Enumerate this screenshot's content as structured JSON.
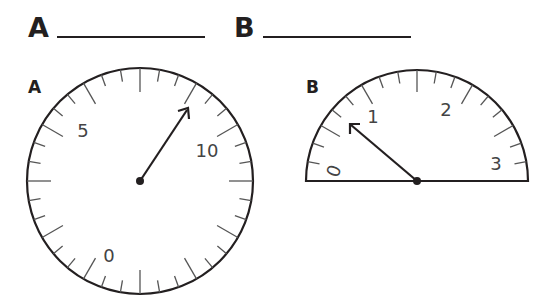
{
  "answers": [
    {
      "letter": "A",
      "value": ""
    },
    {
      "letter": "B",
      "value": ""
    }
  ],
  "gauges": {
    "A": {
      "label": "A",
      "shape": "circle",
      "scale_labels": [
        "0",
        "5",
        "10"
      ],
      "needle_angle_deg_from_top_clockwise": 35
    },
    "B": {
      "label": "B",
      "shape": "semicircle",
      "scale_labels": [
        "0",
        "1",
        "2",
        "3"
      ],
      "needle_angle_deg_from_left_baseline": 40
    }
  },
  "colors": {
    "ink": "#231f20",
    "tick": "#555555"
  }
}
